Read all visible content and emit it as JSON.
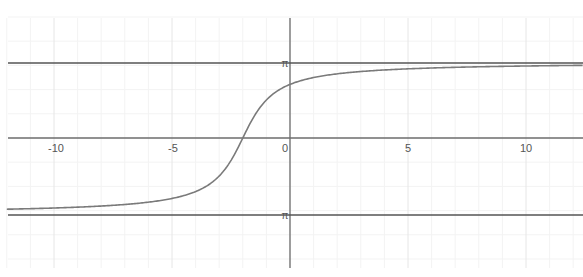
{
  "chart_data": {
    "type": "line",
    "title": "",
    "xlabel": "",
    "ylabel": "",
    "function": "y = 2·arctan(x + 2)",
    "xlim": [
      -12.3,
      12.4
    ],
    "ylim": [
      -5.8,
      5.8
    ],
    "grid": true,
    "legend": "none",
    "x_ticks": [
      {
        "value": -10,
        "label": "-10"
      },
      {
        "value": -5,
        "label": "-5"
      },
      {
        "value": 0,
        "label": "0"
      },
      {
        "value": 5,
        "label": "5"
      },
      {
        "value": 10,
        "label": "10"
      }
    ],
    "y_ticks": [
      {
        "value": 3.14159,
        "label": "π"
      },
      {
        "value": -3.14159,
        "label": "-π"
      }
    ],
    "series": [
      {
        "name": "curve",
        "color": "#7a7a7a",
        "x": [
          -12,
          -10,
          -8,
          -6,
          -5,
          -4,
          -3,
          -2.5,
          -2,
          -1.5,
          -1,
          0,
          1,
          2,
          4,
          6,
          8,
          10,
          12
        ],
        "y": [
          -2.944,
          -2.976,
          -2.944,
          -2.652,
          -2.498,
          -2.214,
          -1.571,
          -0.927,
          0.0,
          0.927,
          1.571,
          2.214,
          2.498,
          2.652,
          2.819,
          2.895,
          2.944,
          2.976,
          2.999
        ]
      },
      {
        "name": "upper asymptote y = π",
        "color": "#555555",
        "x": [
          -12.3,
          12.4
        ],
        "y": [
          3.14159,
          3.14159
        ]
      },
      {
        "name": "lower asymptote y = -π",
        "color": "#555555",
        "x": [
          -12.3,
          12.4
        ],
        "y": [
          -3.14159,
          -3.14159
        ]
      }
    ]
  },
  "labels": {
    "x_neg10": "-10",
    "x_neg5": "-5",
    "x_0": "0",
    "x_5": "5",
    "x_10": "10",
    "y_pi": "π",
    "y_neg_pi": "π"
  },
  "colors": {
    "axis": "#6e6e6e",
    "asymptote": "#555555",
    "curve": "#7a7a7a",
    "grid_major": "#e6e6e6",
    "grid_minor": "#f3f3f3",
    "tick_label": "#555555"
  }
}
